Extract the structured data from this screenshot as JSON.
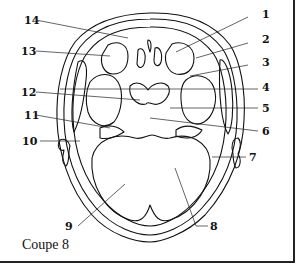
{
  "figure": {
    "caption": "Coupe 8",
    "labels": [
      {
        "number": "1",
        "x": 262,
        "y": 14,
        "side": "right"
      },
      {
        "number": "2",
        "x": 262,
        "y": 39,
        "side": "right"
      },
      {
        "number": "3",
        "x": 262,
        "y": 61,
        "side": "right"
      },
      {
        "number": "4",
        "x": 262,
        "y": 84,
        "side": "right"
      },
      {
        "number": "5",
        "x": 262,
        "y": 103,
        "side": "right"
      },
      {
        "number": "6",
        "x": 262,
        "y": 126,
        "side": "right"
      },
      {
        "number": "7",
        "x": 250,
        "y": 153,
        "side": "right"
      },
      {
        "number": "8",
        "x": 211,
        "y": 223,
        "side": "right"
      },
      {
        "number": "9",
        "x": 64,
        "y": 223,
        "side": "left"
      },
      {
        "number": "10",
        "x": 24,
        "y": 137,
        "side": "left"
      },
      {
        "number": "11",
        "x": 24,
        "y": 111,
        "side": "left"
      },
      {
        "number": "12",
        "x": 22,
        "y": 88,
        "side": "left"
      },
      {
        "number": "13",
        "x": 22,
        "y": 47,
        "side": "left"
      },
      {
        "number": "14",
        "x": 24,
        "y": 17,
        "side": "left"
      }
    ],
    "line_color": "#111111",
    "background": "#ffffff"
  }
}
